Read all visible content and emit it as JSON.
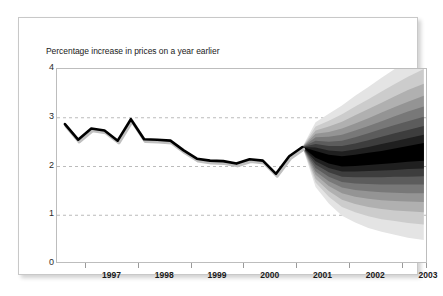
{
  "chart_data": {
    "type": "area",
    "title": "Percentage increase in prices on a year earlier",
    "xlabel": "",
    "ylabel": "",
    "ylim": [
      0,
      4
    ],
    "yticks": [
      0,
      1,
      2,
      3,
      4
    ],
    "ytick_labels": [
      "0",
      "1",
      "2",
      "3",
      "4"
    ],
    "xtick_labels": [
      "1997",
      "1998",
      "1999",
      "2000",
      "2001",
      "2002",
      "2003"
    ],
    "gridlines": {
      "horizontal": [
        1,
        2,
        3
      ],
      "style": "dashed",
      "color": "#aaaaaa"
    },
    "legend": "none",
    "annotations": [],
    "history": {
      "name": "Actual inflation (RPIX)",
      "color": "#000000",
      "shadow_color": "#c0c0c0",
      "x_start": 1996.6,
      "x_end": 2001.1,
      "x": [
        1996.6,
        1996.85,
        1997.1,
        1997.35,
        1997.6,
        1997.85,
        1998.1,
        1998.35,
        1998.6,
        1998.85,
        1999.1,
        1999.35,
        1999.6,
        1999.85,
        2000.1,
        2000.35,
        2000.6,
        2000.85,
        2001.1
      ],
      "values": [
        2.87,
        2.55,
        2.78,
        2.74,
        2.53,
        2.97,
        2.56,
        2.55,
        2.53,
        2.33,
        2.16,
        2.12,
        2.11,
        2.06,
        2.15,
        2.12,
        1.85,
        2.21,
        2.4
      ]
    },
    "forecast": {
      "name": "Inflation projection fan",
      "x_start": 2001.1,
      "x_end": 2003.4,
      "x": [
        2001.1,
        2001.35,
        2001.6,
        2001.85,
        2002.1,
        2002.35,
        2002.6,
        2002.85,
        2003.1,
        2003.4
      ],
      "central": [
        2.4,
        2.25,
        2.15,
        2.1,
        2.12,
        2.15,
        2.18,
        2.22,
        2.26,
        2.3
      ],
      "bands": [
        {
          "probability": 10,
          "color": "#000000",
          "lower": [
            2.4,
            2.18,
            2.06,
            2.0,
            2.01,
            2.03,
            2.05,
            2.07,
            2.1,
            2.12
          ],
          "upper": [
            2.4,
            2.32,
            2.24,
            2.21,
            2.24,
            2.28,
            2.32,
            2.37,
            2.42,
            2.48
          ]
        },
        {
          "probability": 20,
          "color": "#1f1f1f",
          "lower": [
            2.4,
            2.11,
            1.97,
            1.9,
            1.9,
            1.91,
            1.92,
            1.93,
            1.95,
            1.96
          ],
          "upper": [
            2.4,
            2.39,
            2.33,
            2.31,
            2.35,
            2.4,
            2.46,
            2.52,
            2.58,
            2.65
          ]
        },
        {
          "probability": 30,
          "color": "#3d3d3d",
          "lower": [
            2.4,
            2.04,
            1.88,
            1.79,
            1.78,
            1.78,
            1.78,
            1.79,
            1.79,
            1.8
          ],
          "upper": [
            2.4,
            2.46,
            2.42,
            2.42,
            2.47,
            2.54,
            2.61,
            2.68,
            2.75,
            2.83
          ]
        },
        {
          "probability": 40,
          "color": "#5c5c5c",
          "lower": [
            2.4,
            1.97,
            1.79,
            1.68,
            1.65,
            1.64,
            1.63,
            1.63,
            1.63,
            1.63
          ],
          "upper": [
            2.4,
            2.53,
            2.51,
            2.53,
            2.6,
            2.68,
            2.77,
            2.85,
            2.93,
            3.02
          ]
        },
        {
          "probability": 50,
          "color": "#787878",
          "lower": [
            2.4,
            1.9,
            1.7,
            1.57,
            1.52,
            1.49,
            1.47,
            1.46,
            1.45,
            1.45
          ],
          "upper": [
            2.4,
            2.6,
            2.61,
            2.65,
            2.74,
            2.83,
            2.93,
            3.03,
            3.13,
            3.23
          ]
        },
        {
          "probability": 60,
          "color": "#949494",
          "lower": [
            2.4,
            1.83,
            1.6,
            1.45,
            1.38,
            1.34,
            1.31,
            1.29,
            1.28,
            1.27
          ],
          "upper": [
            2.4,
            2.67,
            2.71,
            2.78,
            2.88,
            2.99,
            3.11,
            3.22,
            3.33,
            3.45
          ]
        },
        {
          "probability": 70,
          "color": "#b0b0b0",
          "lower": [
            2.4,
            1.75,
            1.5,
            1.32,
            1.23,
            1.17,
            1.13,
            1.1,
            1.08,
            1.06
          ],
          "upper": [
            2.4,
            2.74,
            2.82,
            2.92,
            3.05,
            3.18,
            3.31,
            3.44,
            3.57,
            3.7
          ]
        },
        {
          "probability": 80,
          "color": "#cccccc",
          "lower": [
            2.4,
            1.67,
            1.38,
            1.17,
            1.06,
            0.98,
            0.92,
            0.88,
            0.84,
            0.81
          ],
          "upper": [
            2.4,
            2.82,
            2.94,
            3.07,
            3.23,
            3.38,
            3.54,
            3.69,
            3.84,
            4.0
          ]
        },
        {
          "probability": 90,
          "color": "#e4e4e4",
          "lower": [
            2.4,
            1.58,
            1.24,
            0.99,
            0.85,
            0.74,
            0.66,
            0.6,
            0.54,
            0.49
          ],
          "upper": [
            2.4,
            2.91,
            3.08,
            3.25,
            3.45,
            3.63,
            3.82,
            4.0,
            4.0,
            4.0
          ]
        }
      ]
    }
  },
  "card": {
    "title": "Percentage increase in prices on a year earlier"
  }
}
